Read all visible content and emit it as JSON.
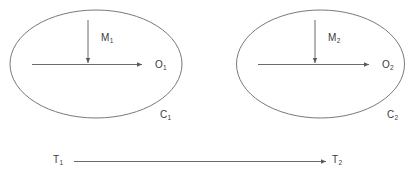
{
  "diagram": {
    "background_color": "#ffffff",
    "stroke_color": "#5a5a5a",
    "text_color": "#3a3a3a",
    "systems": [
      {
        "container_label": "C",
        "container_sub": "1",
        "vertical_arrow_label": "M",
        "vertical_arrow_sub": "1",
        "horizontal_arrow_label": "O",
        "horizontal_arrow_sub": "1"
      },
      {
        "container_label": "C",
        "container_sub": "2",
        "vertical_arrow_label": "M",
        "vertical_arrow_sub": "2",
        "horizontal_arrow_label": "O",
        "horizontal_arrow_sub": "2"
      }
    ],
    "timeline": {
      "start_label": "T",
      "start_sub": "1",
      "end_label": "T",
      "end_sub": "2"
    }
  }
}
